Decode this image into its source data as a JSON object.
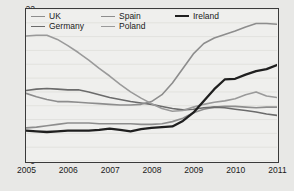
{
  "chart_data": {
    "type": "line",
    "title": "",
    "xlabel": "",
    "ylabel": "",
    "xlim": [
      2005,
      2011
    ],
    "ylim": [
      0,
      22
    ],
    "yticks": [
      0,
      2,
      4,
      6,
      8,
      10,
      12,
      14,
      16,
      18,
      20,
      22
    ],
    "xticks": [
      2005,
      2006,
      2007,
      2008,
      2009,
      2010,
      2011
    ],
    "grid": "horizontal-faint",
    "legend_position": "top-inside",
    "x": [
      2005.0,
      2005.25,
      2005.5,
      2005.75,
      2006.0,
      2006.25,
      2006.5,
      2006.75,
      2007.0,
      2007.25,
      2007.5,
      2007.75,
      2008.0,
      2008.25,
      2008.5,
      2008.75,
      2009.0,
      2009.25,
      2009.5,
      2009.75,
      2010.0,
      2010.25,
      2010.5,
      2010.75,
      2011.0
    ],
    "series": [
      {
        "name": "UK",
        "color": "#8d8d8d",
        "width": 1.6,
        "values": [
          4.8,
          4.9,
          5.1,
          5.3,
          5.5,
          5.5,
          5.5,
          5.4,
          5.4,
          5.4,
          5.4,
          5.3,
          5.3,
          5.4,
          5.7,
          6.2,
          7.0,
          7.5,
          7.8,
          7.9,
          7.9,
          7.8,
          7.7,
          7.8,
          7.8
        ]
      },
      {
        "name": "Germany",
        "color": "#6b6b6b",
        "width": 1.6,
        "values": [
          10.2,
          10.4,
          10.5,
          10.4,
          10.3,
          10.3,
          10.0,
          9.6,
          9.2,
          8.9,
          8.6,
          8.4,
          8.2,
          7.9,
          7.6,
          7.4,
          7.5,
          7.7,
          7.8,
          7.7,
          7.5,
          7.3,
          7.1,
          6.8,
          6.6
        ]
      },
      {
        "name": "Spain",
        "color": "#8d8d8d",
        "width": 1.6,
        "values": [
          9.8,
          9.3,
          8.9,
          8.6,
          8.6,
          8.5,
          8.4,
          8.3,
          8.2,
          8.1,
          8.1,
          8.2,
          8.6,
          9.6,
          11.3,
          13.4,
          15.5,
          17.0,
          17.8,
          18.3,
          18.8,
          19.4,
          19.9,
          19.9,
          19.8
        ]
      },
      {
        "name": "Poland",
        "color": "#9a9a9a",
        "width": 1.6,
        "values": [
          18.1,
          18.2,
          18.2,
          17.6,
          16.7,
          15.7,
          14.6,
          13.4,
          12.3,
          11.1,
          10.0,
          9.1,
          8.3,
          7.6,
          7.2,
          7.3,
          7.8,
          8.2,
          8.5,
          8.7,
          9.0,
          9.6,
          10.0,
          9.4,
          9.2
        ]
      },
      {
        "name": "Ireland",
        "color": "#1f1f1f",
        "width": 2.3,
        "values": [
          4.4,
          4.3,
          4.2,
          4.3,
          4.4,
          4.4,
          4.4,
          4.5,
          4.7,
          4.5,
          4.3,
          4.6,
          4.8,
          4.9,
          5.0,
          5.8,
          7.0,
          8.7,
          10.4,
          11.8,
          11.9,
          12.5,
          13.0,
          13.3,
          13.9
        ]
      }
    ]
  },
  "legend": {
    "items": [
      {
        "label": "UK"
      },
      {
        "label": "Spain"
      },
      {
        "label": "Ireland"
      },
      {
        "label": "Germany"
      },
      {
        "label": "Poland"
      }
    ]
  },
  "axes": {
    "y_tick_labels": [
      "0",
      "2",
      "4",
      "6",
      "8",
      "10",
      "12",
      "14",
      "16",
      "18",
      "20",
      "22"
    ],
    "x_tick_labels": [
      "2005",
      "2006",
      "2007",
      "2008",
      "2009",
      "2010",
      "2011"
    ]
  }
}
